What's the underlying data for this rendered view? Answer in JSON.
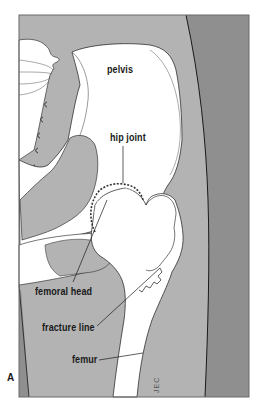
{
  "figure": {
    "panel_letter": "A",
    "signature": "JEC",
    "colors": {
      "background": "#ffffff",
      "soft_tissue": "#b3b3b3",
      "outer_band": "#8f8f8f",
      "bone": "#ffffff",
      "outline": "#1a1a1a",
      "frame": "#6a6a6a"
    },
    "labels": [
      {
        "id": "pelvis",
        "text": "pelvis"
      },
      {
        "id": "hip-joint",
        "text": "hip joint"
      },
      {
        "id": "femoral-head",
        "text": "femoral head"
      },
      {
        "id": "fracture-line",
        "text": "fracture line"
      },
      {
        "id": "femur",
        "text": "femur"
      }
    ]
  }
}
